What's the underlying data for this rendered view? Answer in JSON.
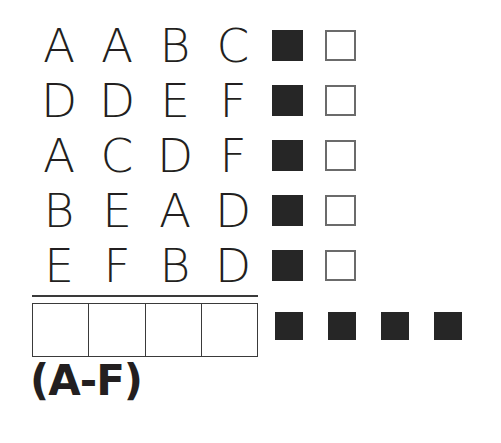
{
  "colors": {
    "ink": "#231f20",
    "filled_square": "#262626",
    "outline_square_border": "#6b6b6b",
    "rule": "#3a3a3a",
    "background": "#ffffff"
  },
  "letter_grid": {
    "rows": [
      {
        "cells": [
          "A",
          "A",
          "B",
          "C"
        ]
      },
      {
        "cells": [
          "D",
          "D",
          "E",
          "F"
        ]
      },
      {
        "cells": [
          "A",
          "C",
          "D",
          "F"
        ]
      },
      {
        "cells": [
          "B",
          "E",
          "A",
          "D"
        ]
      },
      {
        "cells": [
          "E",
          "F",
          "B",
          "D"
        ]
      }
    ]
  },
  "marker_column": {
    "rows": [
      {
        "filled": "filled-square",
        "outline": "outline-square"
      },
      {
        "filled": "filled-square",
        "outline": "outline-square"
      },
      {
        "filled": "filled-square",
        "outline": "outline-square"
      },
      {
        "filled": "filled-square",
        "outline": "outline-square"
      },
      {
        "filled": "filled-square",
        "outline": "outline-square"
      }
    ]
  },
  "answer_table": {
    "cells": [
      "",
      "",
      "",
      ""
    ]
  },
  "bottom_markers": {
    "squares": [
      "filled-square",
      "filled-square",
      "filled-square",
      "filled-square"
    ]
  },
  "caption": {
    "text": "(A-F)"
  }
}
